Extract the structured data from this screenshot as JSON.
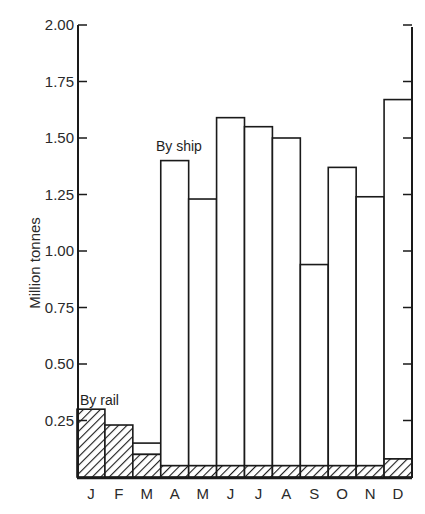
{
  "chart_data": {
    "type": "bar",
    "stacked": true,
    "title": "",
    "xlabel": "",
    "ylabel": "Million tonnes",
    "ylim": [
      0,
      2.0
    ],
    "yticks": [
      0.25,
      0.5,
      0.75,
      1.0,
      1.25,
      1.5,
      1.75,
      2.0
    ],
    "ytick_labels": [
      "0.25",
      "0.50",
      "0.75",
      "1.00",
      "1.25",
      "1.50",
      "1.75",
      "2.00"
    ],
    "categories": [
      "J",
      "F",
      "M",
      "A",
      "M",
      "J",
      "J",
      "A",
      "S",
      "O",
      "N",
      "D"
    ],
    "series": [
      {
        "name": "By rail",
        "pattern": "hatched",
        "values": [
          0.3,
          0.23,
          0.1,
          0.05,
          0.05,
          0.05,
          0.05,
          0.05,
          0.05,
          0.05,
          0.05,
          0.08
        ]
      },
      {
        "name": "By ship",
        "pattern": "open",
        "values": [
          0.0,
          0.0,
          0.05,
          1.35,
          1.18,
          1.54,
          1.5,
          1.45,
          0.89,
          1.32,
          1.19,
          1.59
        ]
      }
    ],
    "totals": [
      0.3,
      0.23,
      0.15,
      1.4,
      1.23,
      1.59,
      1.55,
      1.5,
      0.94,
      1.37,
      1.24,
      1.67
    ],
    "annotations": [
      {
        "text": "By ship",
        "near": "A"
      },
      {
        "text": "By rail",
        "near": "J"
      }
    ],
    "grid": false,
    "legend": "inline annotations"
  },
  "colors": {
    "ink": "#1a1a1a",
    "background": "#ffffff"
  }
}
